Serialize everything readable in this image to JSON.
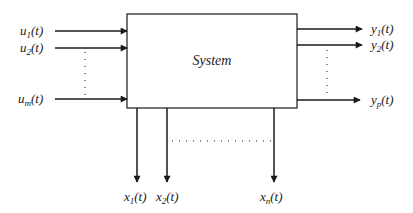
{
  "diagram": {
    "system_label": "System",
    "colors": {
      "stroke": "#1a1a1a",
      "background": "#ffffff"
    },
    "inputs": [
      {
        "base": "u",
        "sub": "1",
        "suffix": "(t)"
      },
      {
        "base": "u",
        "sub": "2",
        "suffix": "(t)"
      },
      {
        "base": "u",
        "sub": "m",
        "suffix": "(t)"
      }
    ],
    "outputs": [
      {
        "base": "y",
        "sub": "1",
        "suffix": "(t)"
      },
      {
        "base": "y",
        "sub": "2",
        "suffix": "(t)"
      },
      {
        "base": "y",
        "sub": "p",
        "suffix": "(t)"
      }
    ],
    "states": [
      {
        "base": "x",
        "sub": "1",
        "suffix": "(t)"
      },
      {
        "base": "x",
        "sub": "2",
        "suffix": "(t)"
      },
      {
        "base": "x",
        "sub": "n",
        "suffix": "(t)"
      }
    ]
  }
}
